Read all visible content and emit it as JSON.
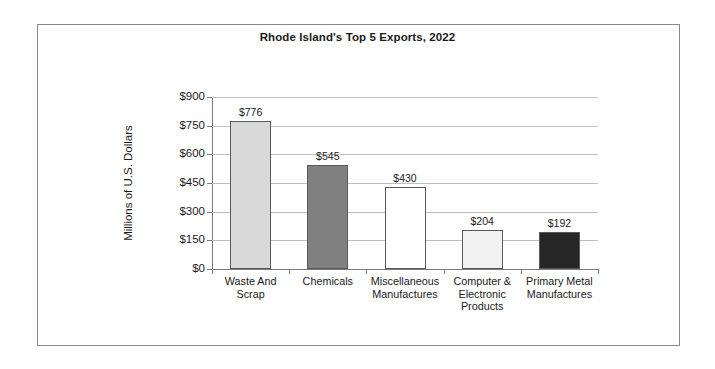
{
  "chart_data": {
    "type": "bar",
    "title": "Rhode Island's Top 5 Exports, 2022",
    "xlabel": "",
    "ylabel": "Millions of U.S. Dollars",
    "ylim": [
      0,
      900
    ],
    "ytick_labels": [
      "$900",
      "$750",
      "$600",
      "$450",
      "$300",
      "$150",
      "$0"
    ],
    "ytick_values": [
      900,
      750,
      600,
      450,
      300,
      150,
      0
    ],
    "grid": true,
    "legend": "none",
    "categories": [
      "Waste And Scrap",
      "Chemicals",
      "Miscellaneous Manufactures",
      "Computer & Electronic Products",
      "Primary Metal Manufactures"
    ],
    "category_lines": [
      [
        "Waste And",
        "Scrap"
      ],
      [
        "Chemicals"
      ],
      [
        "Miscellaneous",
        "Manufactures"
      ],
      [
        "Computer &",
        "Electronic",
        "Products"
      ],
      [
        "Primary Metal",
        "Manufactures"
      ]
    ],
    "values": [
      776,
      545,
      430,
      204,
      192
    ],
    "value_labels": [
      "$776",
      "$545",
      "$430",
      "$204",
      "$192"
    ],
    "bar_colors": [
      "#d9d9d9",
      "#808080",
      "#ffffff",
      "#f2f2f2",
      "#262626"
    ],
    "bar_border_color": "#595959",
    "gridline_color": "#bfbfbf",
    "axis_color": "#7a7a7a",
    "background": "#ffffff"
  }
}
